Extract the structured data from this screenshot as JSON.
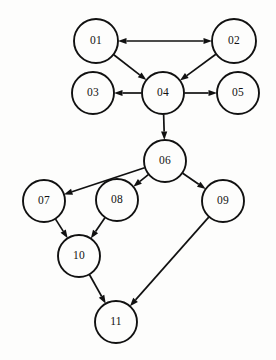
{
  "diagram": {
    "type": "directed-graph",
    "background_color": "#fdfdfc",
    "stroke_color": "#111111",
    "node_fill_color": "#fdfdfc",
    "node_radius": 21,
    "nodes": [
      {
        "id": "01",
        "label": "01",
        "x": 96,
        "y": 41,
        "r": 22
      },
      {
        "id": "02",
        "label": "02",
        "x": 234,
        "y": 41,
        "r": 22
      },
      {
        "id": "03",
        "label": "03",
        "x": 93,
        "y": 93,
        "r": 21
      },
      {
        "id": "04",
        "label": "04",
        "x": 163,
        "y": 93,
        "r": 21
      },
      {
        "id": "05",
        "label": "05",
        "x": 238,
        "y": 93,
        "r": 21
      },
      {
        "id": "06",
        "label": "06",
        "x": 165,
        "y": 161,
        "r": 21
      },
      {
        "id": "07",
        "label": "07",
        "x": 44,
        "y": 201,
        "r": 21
      },
      {
        "id": "08",
        "label": "08",
        "x": 117,
        "y": 200,
        "r": 21
      },
      {
        "id": "09",
        "label": "09",
        "x": 223,
        "y": 201,
        "r": 21
      },
      {
        "id": "10",
        "label": "10",
        "x": 79,
        "y": 256,
        "r": 21
      },
      {
        "id": "11",
        "label": "11",
        "x": 116,
        "y": 322,
        "r": 21
      }
    ],
    "edges": [
      {
        "from": "01",
        "to": "02",
        "directed": "both"
      },
      {
        "from": "01",
        "to": "04",
        "directed": "forward"
      },
      {
        "from": "02",
        "to": "04",
        "directed": "forward"
      },
      {
        "from": "04",
        "to": "03",
        "directed": "forward"
      },
      {
        "from": "04",
        "to": "05",
        "directed": "forward"
      },
      {
        "from": "04",
        "to": "06",
        "directed": "forward"
      },
      {
        "from": "06",
        "to": "07",
        "directed": "forward"
      },
      {
        "from": "06",
        "to": "08",
        "directed": "forward"
      },
      {
        "from": "06",
        "to": "09",
        "directed": "forward"
      },
      {
        "from": "07",
        "to": "10",
        "directed": "forward"
      },
      {
        "from": "08",
        "to": "10",
        "directed": "forward"
      },
      {
        "from": "10",
        "to": "11",
        "directed": "forward"
      },
      {
        "from": "09",
        "to": "11",
        "directed": "forward"
      }
    ]
  }
}
